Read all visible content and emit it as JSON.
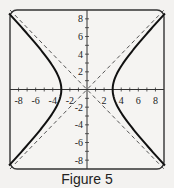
{
  "caption": "Figure 5",
  "chart_data": {
    "type": "line",
    "title": "Figure 5",
    "xlabel": "",
    "ylabel": "",
    "xlim": [
      -9,
      9
    ],
    "ylim": [
      -9,
      9
    ],
    "grid": false,
    "x_ticks": [
      -8,
      -6,
      -4,
      -2,
      2,
      4,
      6,
      8
    ],
    "y_ticks": [
      -8,
      -6,
      -4,
      -2,
      2,
      4,
      6,
      8
    ],
    "series": [
      {
        "name": "hyperbola x^2/9 - y^2/9 = 1 (right branch)",
        "style": "solid",
        "x": [
          9.0,
          7.0,
          5.0,
          4.0,
          3.5,
          3.0,
          3.5,
          4.0,
          5.0,
          7.0,
          9.0
        ],
        "y": [
          8.49,
          6.32,
          4.0,
          2.65,
          1.8,
          0.0,
          -1.8,
          -2.65,
          -4.0,
          -6.32,
          -8.49
        ]
      },
      {
        "name": "hyperbola (left branch)",
        "style": "solid",
        "x": [
          -9.0,
          -7.0,
          -5.0,
          -4.0,
          -3.5,
          -3.0,
          -3.5,
          -4.0,
          -5.0,
          -7.0,
          -9.0
        ],
        "y": [
          8.49,
          6.32,
          4.0,
          2.65,
          1.8,
          0.0,
          -1.8,
          -2.65,
          -4.0,
          -6.32,
          -8.49
        ]
      },
      {
        "name": "asymptote y = x",
        "style": "dashed",
        "x": [
          -9,
          9
        ],
        "y": [
          -9,
          9
        ]
      },
      {
        "name": "asymptote y = -x",
        "style": "dashed",
        "x": [
          -9,
          9
        ],
        "y": [
          9,
          -9
        ]
      }
    ]
  }
}
